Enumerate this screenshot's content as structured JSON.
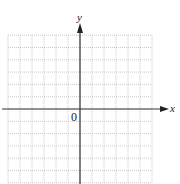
{
  "diagram": {
    "type": "blank coordinate grid",
    "x_axis_label": "x",
    "y_axis_label": "y",
    "origin_label": "0",
    "grid": {
      "columns_left_of_origin": 6,
      "columns_right_of_origin": 6,
      "rows_above_origin": 6,
      "rows_below_origin": 6,
      "line_style": "dotted",
      "line_color": "#bdbdbd"
    },
    "axis_color": "#333333"
  }
}
